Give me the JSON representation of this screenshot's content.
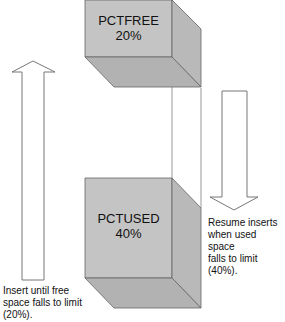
{
  "diagram": {
    "top_block": {
      "title": "PCTFREE",
      "value": "20%"
    },
    "bottom_block": {
      "title": "PCTUSED",
      "value": "40%"
    },
    "up_arrow": {
      "direction": "up",
      "caption_lines": [
        "Insert until free",
        "space falls to limit",
        "(20%)."
      ]
    },
    "down_arrow": {
      "direction": "down",
      "caption_lines": [
        "Resume inserts",
        "when used space",
        "falls to limit (40%)."
      ]
    },
    "colors": {
      "block_front": "#c4c4c4",
      "block_side": "#b8b8b8",
      "block_bottom": "#b0b0b0",
      "outline": "#555555",
      "arrow_stroke": "#777777"
    }
  }
}
